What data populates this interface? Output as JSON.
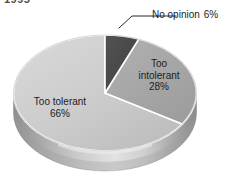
{
  "header": {
    "cropped_text": "1995"
  },
  "chart_data": {
    "type": "pie",
    "title": "",
    "subtitle": "",
    "xlabel": "",
    "ylabel": "",
    "legend_position": "none",
    "grid": false,
    "style": "3d-pie",
    "start_angle_deg": 0,
    "direction": "clockwise",
    "categories": [
      "No opinion",
      "Too intolerant",
      "Too tolerant"
    ],
    "values": [
      6,
      28,
      66
    ],
    "value_unit": "%",
    "slices": [
      {
        "label": "No opinion",
        "value": 6,
        "value_text": "6%",
        "color": "#4a4a4a",
        "side_color": "#3a3a3a",
        "label_placement": "outside-leader-line"
      },
      {
        "label": "Too intolerant",
        "value": 28,
        "value_text": "28%",
        "color": "#a9a9a9",
        "side_color": "#8d8d8d",
        "label_placement": "inside"
      },
      {
        "label": "Too tolerant",
        "value": 66,
        "value_text": "66%",
        "color": "#cdcdcd",
        "side_color": "#b4b4b4",
        "label_placement": "inside"
      }
    ],
    "colors": [
      "#4a4a4a",
      "#a9a9a9",
      "#cdcdcd"
    ],
    "background_color": "#ffffff",
    "separator_color": "#ffffff"
  },
  "labels": {
    "no_opinion": {
      "text": "No opinion",
      "percent": "6%"
    },
    "too_intolerant": {
      "line1": "Too",
      "line2": "intolerant",
      "percent": "28%"
    },
    "too_tolerant": {
      "line1": "Too tolerant",
      "percent": "66%"
    }
  }
}
